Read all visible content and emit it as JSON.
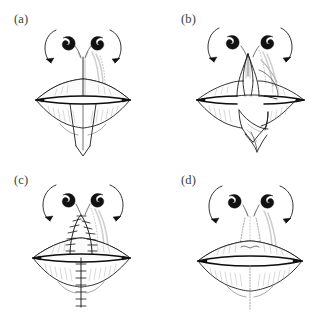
{
  "figure": {
    "background_color": "#ffffff",
    "ink_color": "#1c1c1c",
    "ghost_color": "#b8b8b8",
    "width": 334,
    "height": 321,
    "panel_count": 4
  },
  "panels": [
    {
      "id": "a",
      "label": "(a)",
      "caption_text": "(a)",
      "stage": "incision-planning",
      "description": "Frontal view of nose and lips with planned vertical midline incision extending from the columella through the upper lip and a V-shaped wedge excision marked below the lower lip; curved arrows at both alar rims indicate direction of advancement.",
      "features": [
        "nostrils",
        "alar-rim-arrows",
        "upper-lip",
        "lower-lip",
        "mouth-line",
        "vertical-midline-incision",
        "v-wedge-excision"
      ],
      "arrow_count": 2,
      "suture_count": 0
    },
    {
      "id": "b",
      "label": "(b)",
      "caption_text": "(b)",
      "stage": "flap-elevation",
      "description": "The midline tissue has been incised and the triangular flaps of the upper lip are elevated and splayed outward; the lower lip wedge is reflected downward and laterally.",
      "features": [
        "nostrils",
        "alar-rim-arrows",
        "elevated-upper-flaps",
        "reflected-lower-flap",
        "open-defect"
      ],
      "arrow_count": 2,
      "suture_count": 0
    },
    {
      "id": "c",
      "label": "(c)",
      "caption_text": "(c)",
      "stage": "closure-with-sutures",
      "description": "The defect is closed in the midline; an inverted-V suture line runs through the philtrum to the vermilion border and a vertical suture line continues through the lower lip and chin, all marked with interrupted cross stitches.",
      "features": [
        "nostrils",
        "alar-rim-arrows",
        "philtral-arch-suture-line",
        "vertical-lower-suture-line",
        "interrupted-stitches"
      ],
      "arrow_count": 2,
      "suture_count": 22
    },
    {
      "id": "d",
      "label": "(d)",
      "caption_text": "(d)",
      "stage": "healed-result",
      "description": "Final healed appearance with the sutures removed; only faint dotted scar lines remain in the philtral columns and down the midline of the lower lip and chin.",
      "features": [
        "nostrils",
        "alar-rim-arrows",
        "faint-scar-lines",
        "restored-lip-contour"
      ],
      "arrow_count": 2,
      "suture_count": 0
    }
  ]
}
